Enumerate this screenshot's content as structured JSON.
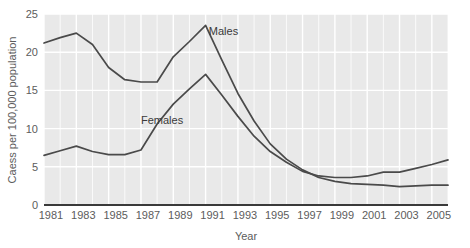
{
  "chart_data": {
    "type": "line",
    "title": "",
    "xlabel": "Year",
    "ylabel": "Caess per 100,000 population",
    "xlim": [
      1981,
      2006
    ],
    "ylim": [
      0,
      25
    ],
    "grid": true,
    "legend_position": "inline-annotation",
    "x": [
      1981,
      1982,
      1983,
      1984,
      1985,
      1986,
      1987,
      1988,
      1989,
      1990,
      1991,
      1992,
      1993,
      1994,
      1995,
      1996,
      1997,
      1998,
      1999,
      2000,
      2001,
      2002,
      2003,
      2004,
      2005,
      2006
    ],
    "xticks": [
      1981,
      1983,
      1985,
      1987,
      1989,
      1991,
      1993,
      1995,
      1997,
      1999,
      2001,
      2003,
      2005
    ],
    "xticklabels": [
      "1981",
      "1983",
      "1985",
      "1987",
      "1989",
      "1991",
      "1993",
      "1995",
      "1997",
      "1999",
      "2001",
      "2003",
      "2005"
    ],
    "yticks": [
      0,
      5,
      10,
      15,
      20,
      25
    ],
    "yticklabels": [
      "0",
      "5",
      "10",
      "15",
      "20",
      "25"
    ],
    "series": [
      {
        "name": "Males",
        "color": "#4a4a4a",
        "label_x": 1991.2,
        "label_y": 22.2,
        "values": [
          21.2,
          21.9,
          22.5,
          21.0,
          18.0,
          16.4,
          16.1,
          16.1,
          19.4,
          21.4,
          23.5,
          19.0,
          14.6,
          11.0,
          8.0,
          6.0,
          4.6,
          3.6,
          3.1,
          2.8,
          2.7,
          2.6,
          2.4,
          2.5,
          2.6,
          2.6
        ]
      },
      {
        "name": "Females",
        "color": "#4a4a4a",
        "label_x": 1987.0,
        "label_y": 10.6,
        "values": [
          6.5,
          7.1,
          7.7,
          7.0,
          6.6,
          6.6,
          7.2,
          10.6,
          13.2,
          15.2,
          17.1,
          14.4,
          11.6,
          9.0,
          7.0,
          5.6,
          4.4,
          3.8,
          3.6,
          3.6,
          3.8,
          4.3,
          4.3,
          4.8,
          5.3,
          5.9
        ]
      }
    ]
  },
  "figure": {
    "plot_background_color": "#e9e9e9",
    "gridline_color": "#ffffff",
    "axis_line_color": "#3a3a3a",
    "tick_label_color": "#5c5c5c"
  }
}
